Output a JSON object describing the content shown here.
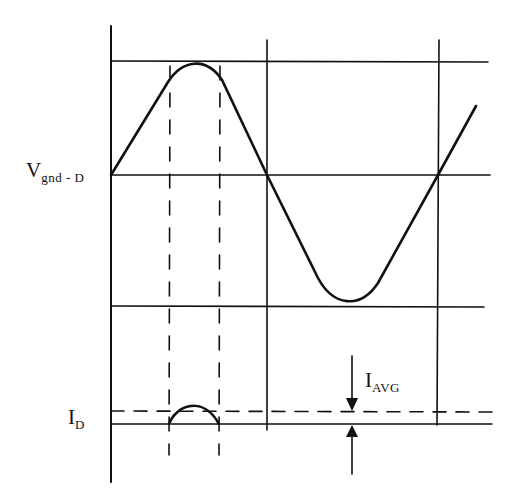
{
  "diagram": {
    "type": "waveform",
    "labels": {
      "voltage_main": "V",
      "voltage_sub": "gnd - D",
      "current_main": "I",
      "current_sub": "D",
      "avg_main": "I",
      "avg_sub": "AVG"
    },
    "colors": {
      "ink": "#111111",
      "background": "#ffffff"
    },
    "waveforms": [
      {
        "name": "V_gnd-D",
        "shape": "sine",
        "cycles_shown": 1.2
      },
      {
        "name": "I_D",
        "shape": "half-sine pulse at positive peak"
      }
    ]
  }
}
